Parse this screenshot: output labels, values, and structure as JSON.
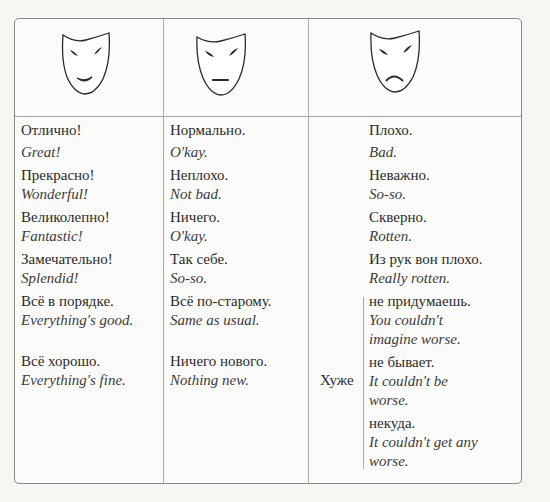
{
  "columns": [
    {
      "mask": "happy-mask-icon",
      "entries": [
        {
          "ru": "Отлично!",
          "en": "Great!"
        },
        {
          "ru": "Прекрасно!",
          "en": "Wonderful!"
        },
        {
          "ru": "Великолепно!",
          "en": "Fantastic!"
        },
        {
          "ru": "Замечательно!",
          "en": "Splendid!"
        },
        {
          "ru": "Всё в порядке.",
          "en": "Everything's good."
        },
        {
          "ru": "Всё хорошо.",
          "en": "Everything's fine."
        }
      ]
    },
    {
      "mask": "neutral-mask-icon",
      "entries": [
        {
          "ru": "Нормально.",
          "en": "O'kay."
        },
        {
          "ru": "Неплохо.",
          "en": "Not bad."
        },
        {
          "ru": "Ничего.",
          "en": "O'kay."
        },
        {
          "ru": "Так себе.",
          "en": "So-so."
        },
        {
          "ru": "Всё по-старому.",
          "en": "Same as usual."
        },
        {
          "ru": "Ничего нового.",
          "en": "Nothing new."
        }
      ]
    },
    {
      "mask": "sad-mask-icon",
      "entries": [
        {
          "ru": "Плохо.",
          "en": "Bad."
        },
        {
          "ru": "Неважно.",
          "en": "So-so."
        },
        {
          "ru": "Скверно.",
          "en": "Rotten."
        },
        {
          "ru": "Из рук вон плохо.",
          "en": "Really rotten."
        }
      ],
      "worse_prefix": "Хуже",
      "worse_entries": [
        {
          "ru": "не придумаешь.",
          "en1": "You couldn't",
          "en2": "imagine worse."
        },
        {
          "ru": "не бывает.",
          "en1": "It couldn't be",
          "en2": "worse."
        },
        {
          "ru": "некуда.",
          "en1": "It couldn't get any",
          "en2": "worse."
        }
      ]
    }
  ]
}
